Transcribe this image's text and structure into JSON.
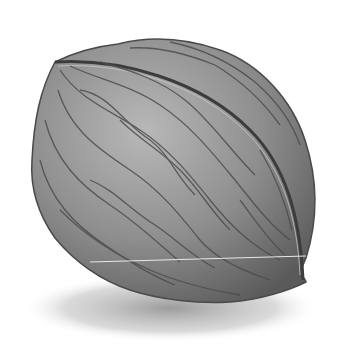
{
  "image": {
    "subject": "walnut",
    "style": "grayscale illustration",
    "colors": {
      "background": "#ffffff",
      "shell_light": "#b4b4b4",
      "shell_mid": "#8c8c8c",
      "shell_dark": "#5e5e5e",
      "vein": "#4a4a4a",
      "shadow": "#9a9a9a",
      "seam_highlight": "#e8e8e8"
    }
  }
}
